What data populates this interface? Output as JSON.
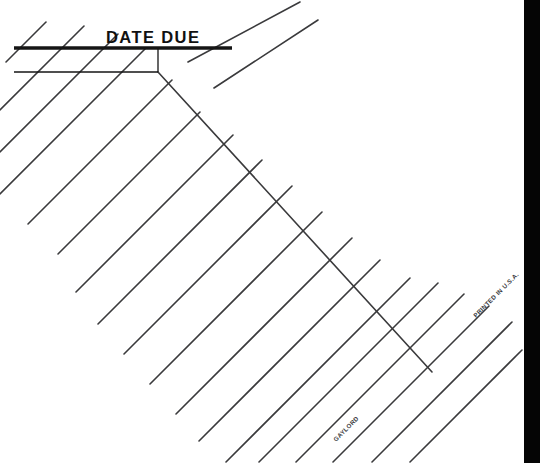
{
  "document": {
    "kind": "library-date-due-slip",
    "header_label": "DATE  DUE",
    "publisher_imprint": "GAYLORD",
    "origin_imprint": "PRINTED IN U.S.A.",
    "background_color": "#ffffff",
    "ink_color": "#3a3a3c",
    "header_ink_color": "#151515",
    "scanner_band_color": "#050505"
  },
  "header": {
    "title": "DATE  DUE",
    "title_x": 106,
    "title_y": 43,
    "thick_rule": {
      "x1": 14,
      "y1": 48,
      "x2": 232,
      "y2": 48,
      "width": 3.4
    },
    "thin_rule": {
      "x1": 14,
      "y1": 72,
      "x2": 158,
      "y2": 72,
      "width": 1.5
    },
    "tick_rule": {
      "x1": 158,
      "y1": 48,
      "x2": 158,
      "y2": 72,
      "width": 1.3
    }
  },
  "grid": {
    "primary_angle_deg": -45,
    "cross_angle_deg": 45,
    "line_width": 1.6,
    "primary_count": 20,
    "cross_count": 1,
    "primary_lines": [
      {
        "x1": 28,
        "y1": 224,
        "x2": 172,
        "y2": 80
      },
      {
        "x1": 58,
        "y1": 254,
        "x2": 200,
        "y2": 112
      },
      {
        "x1": 76,
        "y1": 292,
        "x2": 233,
        "y2": 135
      },
      {
        "x1": 98,
        "y1": 324,
        "x2": 262,
        "y2": 160
      },
      {
        "x1": 124,
        "y1": 354,
        "x2": 292,
        "y2": 186
      },
      {
        "x1": 150,
        "y1": 384,
        "x2": 322,
        "y2": 212
      },
      {
        "x1": 176,
        "y1": 414,
        "x2": 352,
        "y2": 238
      },
      {
        "x1": 199,
        "y1": 441,
        "x2": 380,
        "y2": 260
      },
      {
        "x1": 226,
        "y1": 462,
        "x2": 410,
        "y2": 278
      },
      {
        "x1": 259,
        "y1": 462,
        "x2": 438,
        "y2": 283
      },
      {
        "x1": 296,
        "y1": 462,
        "x2": 464,
        "y2": 294
      },
      {
        "x1": 333,
        "y1": 462,
        "x2": 489,
        "y2": 306
      },
      {
        "x1": 372,
        "y1": 462,
        "x2": 512,
        "y2": 322
      },
      {
        "x1": 410,
        "y1": 462,
        "x2": 522,
        "y2": 350
      },
      {
        "x1": 0,
        "y1": 194,
        "x2": 146,
        "y2": 48
      },
      {
        "x1": 0,
        "y1": 152,
        "x2": 118,
        "y2": 34
      },
      {
        "x1": 0,
        "y1": 110,
        "x2": 84,
        "y2": 26
      },
      {
        "x1": 6,
        "y1": 62,
        "x2": 46,
        "y2": 22
      },
      {
        "x1": 188,
        "y1": 62,
        "x2": 300,
        "y2": 2
      },
      {
        "x1": 214,
        "y1": 88,
        "x2": 318,
        "y2": 20
      }
    ],
    "cross_lines": [
      {
        "x1": 158,
        "y1": 72,
        "x2": 432,
        "y2": 372
      }
    ]
  },
  "slip": {
    "corner_top_x": 300,
    "corner_top_y": 2,
    "edge_note": "paper rotated about 45 degrees, top-right corner visible"
  },
  "imprints": [
    {
      "name": "gaylord",
      "text": "GAYLORD",
      "x": 336,
      "y": 442,
      "rotation_deg": -45,
      "font_size": 6.2
    },
    {
      "name": "printed-in-usa",
      "text": "PRINTED IN U.S.A.",
      "x": 476,
      "y": 318,
      "rotation_deg": -45,
      "font_size": 6.2
    }
  ],
  "scanner_band": {
    "name": "scanner-edge-shadow",
    "x": 524,
    "y": 0,
    "width": 16,
    "height": 463,
    "color": "#050505"
  }
}
